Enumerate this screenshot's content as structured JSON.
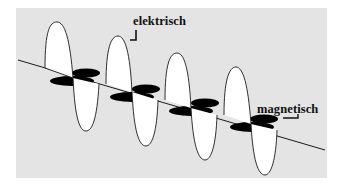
{
  "diagram": {
    "type": "electromagnetic-wave",
    "labels": {
      "electric": "elektrisch",
      "magnetic": "magnetisch"
    },
    "colors": {
      "panel_background": "#e4e4e4",
      "page_background": "#ffffff",
      "electric_field_fill": "#ffffff",
      "magnetic_field_fill": "#000000",
      "outline": "#1a1a1a"
    },
    "elements": {
      "propagation_axis": "diagonal line from upper-left to lower-right",
      "electric_field": "white vertical loops alternating above and below the axis",
      "magnetic_field": "black horizontal lobes alternating front and back along the axis",
      "wave_cycles_visible": 4
    }
  }
}
